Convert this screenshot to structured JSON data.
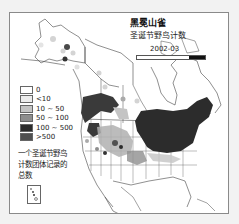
{
  "map": {
    "title": "黑冕山雀",
    "subtitle": "圣诞节野鸟计数",
    "season": "2002-03",
    "timebar": {
      "fill_fraction": 0.23
    },
    "legend": {
      "items": [
        {
          "label": "0",
          "color": "#ffffff"
        },
        {
          "label": "<10",
          "color": "#ececec"
        },
        {
          "label": "10 ~ 50",
          "color": "#c4c4c4"
        },
        {
          "label": "50 ~ 100",
          "color": "#8e8e8e"
        },
        {
          "label": "100 ~ 500",
          "color": "#2c2c2c"
        },
        {
          "label": ">500",
          "color": "#505050"
        }
      ]
    },
    "note": "一个圣诞节野鸟计数团体记录的总数",
    "region": "North America (Alaska, Canada, USA, Mexico)"
  }
}
